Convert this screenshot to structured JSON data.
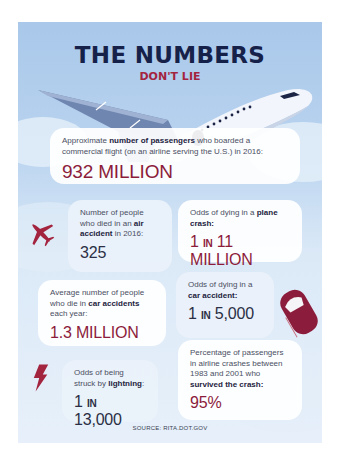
{
  "header": {
    "title": "THE NUMBERS",
    "subtitle": "DON'T LIE"
  },
  "colors": {
    "navy": "#16214a",
    "crimson": "#a3243f",
    "value_red": "#8c1c3b",
    "sky": "#a9c8ea"
  },
  "stats": {
    "passengers": {
      "label_pre": "Approximate ",
      "label_bold": "number of passengers",
      "label_post": " who boarded a commercial flight (on an airline serving the U.S.) in 2016:",
      "value": "932 MILLION",
      "icon": "jet-airliner"
    },
    "air_deaths": {
      "label_pre": "Number of people who died in an ",
      "label_bold": "air accident",
      "label_post": " in 2016:",
      "value": "325",
      "icon": "plane-icon"
    },
    "plane_odds": {
      "label_pre": "Odds of dying in a ",
      "label_bold": "plane crash:",
      "label_post": "",
      "value_a": "1 ",
      "value_in": "IN",
      "value_b": " 11 MILLION"
    },
    "car_deaths": {
      "label_pre": "Average number of people who die in ",
      "label_bold": "car accidents",
      "label_post": " each year:",
      "value": "1.3 MILLION"
    },
    "car_odds": {
      "label_pre": "Odds of dying in a ",
      "label_bold": "car accident:",
      "label_post": "",
      "value_a": "1 ",
      "value_in": "IN",
      "value_b": " 5,000",
      "icon": "car-icon"
    },
    "lightning_odds": {
      "label_pre": "Odds of being struck by ",
      "label_bold": "lightning",
      "label_post": ":",
      "value_a": "1 ",
      "value_in": "IN",
      "value_b": " 13,000",
      "icon": "lightning-icon"
    },
    "survival": {
      "label_pre": "Percentage of passengers in airline crashes between 1983 and 2001 who ",
      "label_bold": "survived the crash:",
      "label_post": "",
      "value": "95%"
    }
  },
  "footer": {
    "source": "SOURCE: RITA.DOT.GOV"
  }
}
